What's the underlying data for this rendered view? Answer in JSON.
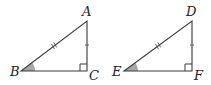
{
  "diagram": {
    "triangles": [
      {
        "name": "triangle-abc",
        "vertices": {
          "A": {
            "label": "A",
            "x": 87,
            "y": 21
          },
          "B": {
            "label": "B",
            "x": 21,
            "y": 71
          },
          "C": {
            "label": "C",
            "x": 87,
            "y": 71
          }
        },
        "right_angle_at": "C",
        "shaded_angle_at": "B",
        "hypotenuse_marks": "double-tick",
        "leg_marks": "single-tick"
      },
      {
        "name": "triangle-def",
        "vertices": {
          "D": {
            "label": "D",
            "x": 192,
            "y": 21
          },
          "E": {
            "label": "E",
            "x": 124,
            "y": 71
          },
          "F": {
            "label": "F",
            "x": 192,
            "y": 71
          }
        },
        "right_angle_at": "F",
        "shaded_angle_at": "E",
        "hypotenuse_marks": "double-tick",
        "leg_marks": "single-tick"
      }
    ],
    "labels": {
      "A": "A",
      "B": "B",
      "C": "C",
      "D": "D",
      "E": "E",
      "F": "F"
    },
    "colors": {
      "stroke": "#3a3a3a",
      "angle_fill": "#a8a8a8",
      "label": "#222222"
    }
  }
}
